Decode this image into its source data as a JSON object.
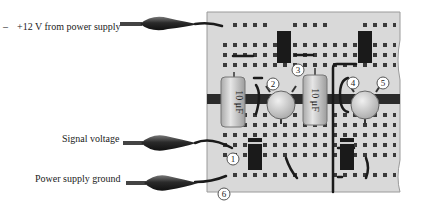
{
  "labels": {
    "dash": "–",
    "power": "+12 V from power supply",
    "signal": "Signal voltage",
    "ground": "Power supply ground"
  },
  "capacitors": [
    {
      "label": "10 μF"
    },
    {
      "label": "10 μF"
    }
  ],
  "node_numbers": [
    "1",
    "2",
    "3",
    "4",
    "5",
    "6"
  ],
  "colors": {
    "board": "#d9d9d9",
    "board_edge": "#9a9a9a",
    "hole": "#3a3a3a",
    "strip": "#2b2b2b",
    "component_dark": "#1a1a1a",
    "capacitor_body": "#cfcfcf",
    "transistor": "#c8c8c8",
    "clip": "#2e2e2e"
  }
}
